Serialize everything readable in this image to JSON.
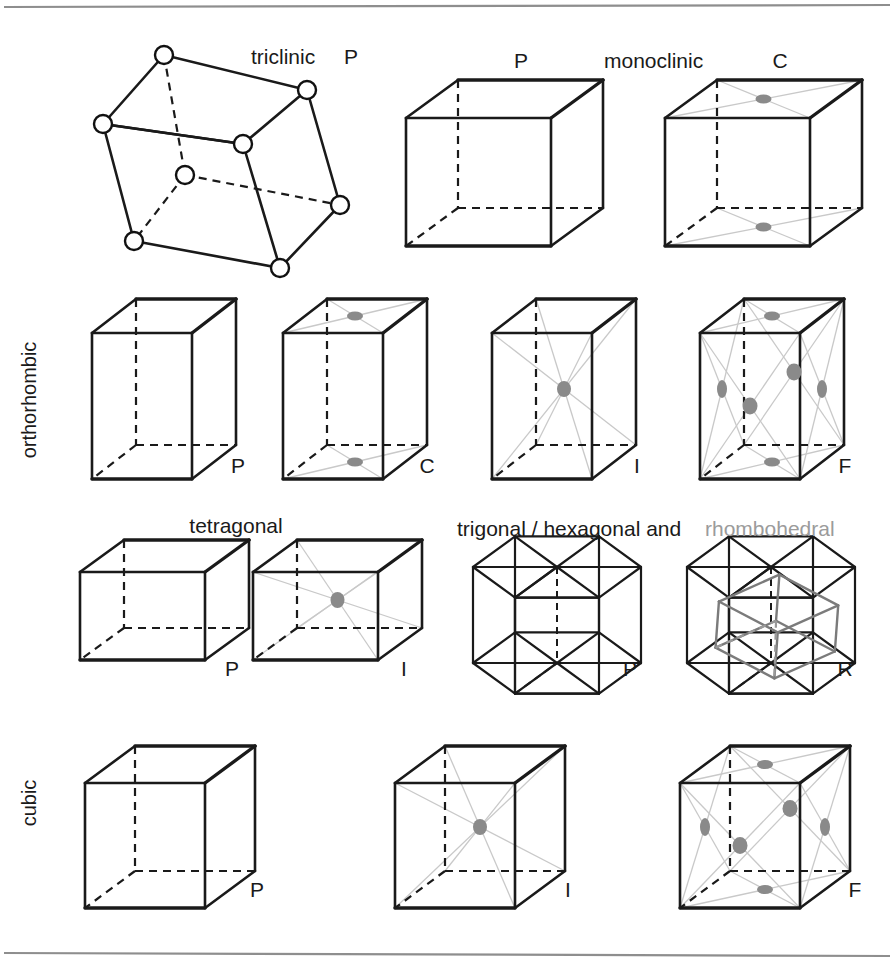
{
  "figure": {
    "background": "#ffffff",
    "rule_color": "#8e8e8e",
    "edge_color": "#1a1a1a",
    "diagonal_color": "#c9c9c9",
    "lattice_dot_color": "#8a8a8a",
    "rhombohedron_color": "#7b7b7b",
    "gray_text_color": "#9b9b9b",
    "rules": [
      {
        "name": "top-rule",
        "y": 6
      },
      {
        "name": "bottom-rule",
        "y": 953
      }
    ]
  },
  "labels": {
    "triclinic": "triclinic",
    "monoclinic": "monoclinic",
    "orthorhombic": "orthorhombic",
    "tetragonal": "tetragonal",
    "trigonal_hexagonal": "trigonal / hexagonal and",
    "rhombohedral": "rhombohedral",
    "cubic": "cubic"
  },
  "symbols": {
    "P": "P",
    "C": "C",
    "I": "I",
    "F": "F",
    "R": "R"
  },
  "rows": [
    {
      "name": "row-triclinic-monoclinic",
      "systems": [
        {
          "system": "triclinic",
          "cells": [
            {
              "name": "triclinic-P",
              "symbol": "P",
              "centering": "primitive",
              "lattice_points": 8,
              "shape": "oblique-parallelepiped",
              "vertices_shown_as": "open-circles"
            }
          ]
        },
        {
          "system": "monoclinic",
          "cells": [
            {
              "name": "monoclinic-P",
              "symbol": "P",
              "centering": "primitive",
              "face_center_dots": 0
            },
            {
              "name": "monoclinic-C",
              "symbol": "C",
              "centering": "base-centred",
              "face_center_dots": 2,
              "dot_faces": [
                "top",
                "bottom"
              ]
            }
          ]
        }
      ]
    },
    {
      "name": "row-orthorhombic",
      "systems": [
        {
          "system": "orthorhombic",
          "cells": [
            {
              "name": "orthorhombic-P",
              "symbol": "P",
              "centering": "primitive",
              "dots": 0
            },
            {
              "name": "orthorhombic-C",
              "symbol": "C",
              "centering": "base-centred",
              "dots": 2,
              "dot_faces": [
                "top",
                "bottom"
              ]
            },
            {
              "name": "orthorhombic-I",
              "symbol": "I",
              "centering": "body-centred",
              "dots": 1,
              "dot_faces": [
                "body-centre"
              ]
            },
            {
              "name": "orthorhombic-F",
              "symbol": "F",
              "centering": "face-centred",
              "dots": 6,
              "dot_faces": [
                "top",
                "bottom",
                "front",
                "back",
                "left",
                "right"
              ]
            }
          ]
        }
      ]
    },
    {
      "name": "row-tetragonal-trigonal",
      "systems": [
        {
          "system": "tetragonal",
          "cells": [
            {
              "name": "tetragonal-P",
              "symbol": "P",
              "centering": "primitive",
              "dots": 0
            },
            {
              "name": "tetragonal-I",
              "symbol": "I",
              "centering": "body-centred",
              "dots": 1,
              "dot_faces": [
                "body-centre"
              ]
            }
          ]
        },
        {
          "system": "trigonal / hexagonal and rhombohedral",
          "cells": [
            {
              "name": "hexagonal-P",
              "symbol": "P",
              "centering": "primitive",
              "shape": "hexagonal-prism"
            },
            {
              "name": "rhombohedral-R",
              "symbol": "R",
              "centering": "rhombohedral",
              "shape": "hexagonal-prism-with-rhombohedron"
            }
          ]
        }
      ]
    },
    {
      "name": "row-cubic",
      "systems": [
        {
          "system": "cubic",
          "cells": [
            {
              "name": "cubic-P",
              "symbol": "P",
              "centering": "primitive",
              "dots": 0
            },
            {
              "name": "cubic-I",
              "symbol": "I",
              "centering": "body-centred",
              "dots": 1,
              "dot_faces": [
                "body-centre"
              ]
            },
            {
              "name": "cubic-F",
              "symbol": "F",
              "centering": "face-centred",
              "dots": 6,
              "dot_faces": [
                "top",
                "bottom",
                "front",
                "back",
                "left",
                "right"
              ]
            }
          ]
        }
      ]
    }
  ],
  "label_positions": {
    "triclinic": {
      "x": 251,
      "y": 64,
      "anchor": "start"
    },
    "triclinic_P": {
      "x": 344,
      "y": 64,
      "anchor": "start"
    },
    "monoclinic_P": {
      "x": 521,
      "y": 68,
      "anchor": "middle"
    },
    "monoclinic": {
      "x": 604,
      "y": 68,
      "anchor": "start"
    },
    "monoclinic_C": {
      "x": 780,
      "y": 68,
      "anchor": "middle"
    },
    "orthorhombic": {
      "x": 36,
      "y": 400,
      "anchor": "middle"
    },
    "orthorhombic_P": {
      "x": 238,
      "y": 473,
      "anchor": "middle"
    },
    "orthorhombic_C": {
      "x": 427,
      "y": 473,
      "anchor": "middle"
    },
    "orthorhombic_I": {
      "x": 637,
      "y": 473,
      "anchor": "middle"
    },
    "orthorhombic_F": {
      "x": 845,
      "y": 473,
      "anchor": "middle"
    },
    "tetragonal": {
      "x": 236,
      "y": 533,
      "anchor": "middle"
    },
    "tetragonal_P": {
      "x": 232,
      "y": 676,
      "anchor": "middle"
    },
    "tetragonal_I": {
      "x": 404,
      "y": 676,
      "anchor": "middle"
    },
    "trigonal_hexagonal": {
      "x": 457,
      "y": 536,
      "anchor": "start"
    },
    "rhombohedral": {
      "x": 705,
      "y": 536,
      "anchor": "start"
    },
    "hexagonal_P": {
      "x": 630,
      "y": 676,
      "anchor": "middle"
    },
    "rhombohedral_R": {
      "x": 845,
      "y": 676,
      "anchor": "middle"
    },
    "cubic": {
      "x": 36,
      "y": 803,
      "anchor": "middle"
    },
    "cubic_P": {
      "x": 257,
      "y": 897,
      "anchor": "middle"
    },
    "cubic_I": {
      "x": 568,
      "y": 897,
      "anchor": "middle"
    },
    "cubic_F": {
      "x": 855,
      "y": 897,
      "anchor": "middle"
    }
  },
  "geometry": {
    "triclinic": {
      "front_top_left": [
        103,
        124
      ],
      "front_top_right": [
        243,
        144
      ],
      "front_bot_left": [
        134,
        241
      ],
      "front_bot_right": [
        280,
        268
      ],
      "back_top_left": [
        164,
        55
      ],
      "back_top_right": [
        307,
        90
      ],
      "back_bot_left": [
        185,
        175
      ],
      "back_bot_right": [
        340,
        205
      ],
      "node_radius": 9
    },
    "monoclinic_P": {
      "x": 406,
      "y": 118,
      "w": 145,
      "h": 128,
      "dx": 52,
      "dy": -38
    },
    "monoclinic_C": {
      "x": 665,
      "y": 118,
      "w": 145,
      "h": 128,
      "dx": 52,
      "dy": -38
    },
    "orthorhombic_P": {
      "x": 92,
      "y": 333,
      "w": 100,
      "h": 146,
      "dx": 44,
      "dy": -34
    },
    "orthorhombic_C": {
      "x": 283,
      "y": 333,
      "w": 100,
      "h": 146,
      "dx": 44,
      "dy": -34
    },
    "orthorhombic_I": {
      "x": 492,
      "y": 333,
      "w": 100,
      "h": 146,
      "dx": 44,
      "dy": -34
    },
    "orthorhombic_F": {
      "x": 700,
      "y": 333,
      "w": 100,
      "h": 146,
      "dx": 44,
      "dy": -34
    },
    "tetragonal_P": {
      "x": 80,
      "y": 572,
      "w": 125,
      "h": 88,
      "dx": 44,
      "dy": -32
    },
    "tetragonal_I": {
      "x": 253,
      "y": 572,
      "w": 125,
      "h": 88,
      "dx": 44,
      "dy": -32
    },
    "hexagonal_P": {
      "cx": 557,
      "cy": 615,
      "r": 84,
      "h": 96,
      "dy": -34
    },
    "hexagonal_R": {
      "cx": 771,
      "cy": 615,
      "r": 84,
      "h": 96,
      "dy": -34
    },
    "cubic_P": {
      "x": 85,
      "y": 783,
      "w": 120,
      "h": 125,
      "dx": 50,
      "dy": -37
    },
    "cubic_I": {
      "x": 395,
      "y": 783,
      "w": 120,
      "h": 125,
      "dx": 50,
      "dy": -37
    },
    "cubic_F": {
      "x": 680,
      "y": 783,
      "w": 120,
      "h": 125,
      "dx": 50,
      "dy": -37
    }
  }
}
